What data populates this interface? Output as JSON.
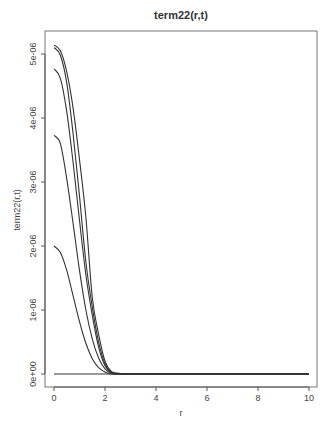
{
  "chart_data": {
    "type": "line",
    "title": "term22(r,t)",
    "xlabel": "r",
    "ylabel": "term22(r,t)",
    "xlim": [
      0,
      10
    ],
    "ylim": [
      0,
      5.14e-06
    ],
    "grid": false,
    "legend": null,
    "x_ticks": [
      0,
      2,
      4,
      6,
      8,
      10
    ],
    "x_tick_labels": [
      "0",
      "2",
      "4",
      "6",
      "8",
      "10"
    ],
    "y_ticks": [
      0,
      1e-06,
      2e-06,
      3e-06,
      4e-06,
      5e-06
    ],
    "y_tick_labels": [
      "0e+00",
      "1e-06",
      "2e-06",
      "3e-06",
      "4e-06",
      "5e-06"
    ],
    "x": [
      0,
      0.25,
      0.5,
      0.75,
      1.0,
      1.25,
      1.5,
      1.75,
      2.0,
      2.25,
      2.5,
      3,
      4,
      6,
      8,
      10
    ],
    "series": [
      {
        "name": "curve-1",
        "values": [
          5.14e-06,
          5.05e-06,
          4.72e-06,
          4.15e-06,
          3.35e-06,
          2.45e-06,
          1.2e-06,
          6.2e-07,
          2e-07,
          4e-08,
          1e-08,
          0,
          0,
          0,
          0,
          0
        ]
      },
      {
        "name": "curve-2",
        "values": [
          5.1e-06,
          4.98e-06,
          4.55e-06,
          3.75e-06,
          2.78e-06,
          1.75e-06,
          1.05e-06,
          5e-07,
          1.6e-07,
          3e-08,
          1e-08,
          0,
          0,
          0,
          0,
          0
        ]
      },
      {
        "name": "curve-3",
        "values": [
          4.77e-06,
          4.62e-06,
          4.1e-06,
          3.3e-06,
          2.4e-06,
          1.55e-06,
          9.2e-07,
          4.2e-07,
          1.3e-07,
          2e-08,
          0.0,
          0,
          0,
          0,
          0,
          0
        ]
      },
      {
        "name": "curve-4",
        "values": [
          3.73e-06,
          3.6e-06,
          3.05e-06,
          2.35e-06,
          1.62e-06,
          1e-06,
          5.5e-07,
          2.5e-07,
          8e-08,
          1e-08,
          0.0,
          0,
          0,
          0,
          0,
          0
        ]
      },
      {
        "name": "curve-5",
        "values": [
          2e-06,
          1.9e-06,
          1.62e-06,
          1.22e-06,
          8.2e-07,
          4.8e-07,
          2.4e-07,
          1e-07,
          3e-08,
          0.0,
          0.0,
          0,
          0,
          0,
          0,
          0
        ]
      },
      {
        "name": "curve-6",
        "values": [
          0,
          0,
          0,
          0,
          0,
          0,
          0,
          0,
          0,
          0,
          0,
          0,
          0,
          0,
          0,
          0
        ]
      }
    ],
    "colors": {
      "line": "#333333",
      "axis": "#555555",
      "box": "#666666"
    }
  }
}
